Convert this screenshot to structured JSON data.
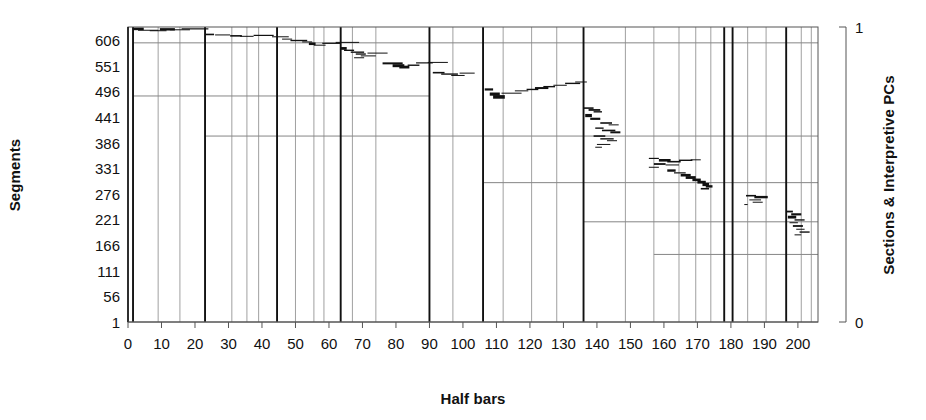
{
  "chart_data": {
    "type": "scatter",
    "title": "",
    "xlabel": "Half bars",
    "ylabel": "Segments",
    "y2label": "Sections & Interpretive PCs",
    "xlim": [
      0,
      206
    ],
    "ylim": [
      1,
      634
    ],
    "y2lim": [
      0,
      1
    ],
    "xticks": [
      0,
      10,
      20,
      30,
      40,
      50,
      60,
      70,
      80,
      90,
      100,
      110,
      120,
      130,
      140,
      150,
      160,
      170,
      180,
      190,
      200
    ],
    "xtick_labels": [
      "0",
      "10",
      "20",
      "30",
      "40",
      "50",
      "60",
      "70",
      "80",
      "90",
      "100",
      "110",
      "120",
      "130",
      "140",
      "150",
      "160",
      "170",
      "180",
      "190",
      "200"
    ],
    "yticks": [
      606,
      551,
      496,
      441,
      386,
      331,
      276,
      221,
      166,
      111,
      56,
      1
    ],
    "ytick_labels": [
      "606",
      "551",
      "496",
      "441",
      "386",
      "331",
      "276",
      "221",
      "166",
      "111",
      "56",
      "1"
    ],
    "y2ticks": [
      0,
      1
    ],
    "y2tick_labels": [
      "0",
      "1"
    ],
    "grid": "vertical-section-lines-and-sparse-horizontal-lines",
    "legend": "none",
    "series_description": "Descending staircase of short horizontal segment markers spanning half-bar positions",
    "section_lines_major": [
      1.5,
      23.0,
      44.5,
      63.5,
      90.0,
      106.0,
      136.0,
      178.0,
      180.5,
      196.5
    ],
    "section_lines_minor": [
      9.0,
      15.5,
      31.0,
      35.5,
      39.0,
      50.0,
      55.5,
      58.5,
      67.0,
      74.0,
      97.0,
      112.0,
      120.5,
      128.0,
      148.5,
      157.0,
      164.5,
      169.5,
      174.0,
      185.0,
      190.5,
      201.0,
      204.0
    ],
    "horizontal_lines": [
      {
        "y": 600,
        "x0": 1.5,
        "x1": 206
      },
      {
        "y": 486,
        "x0": 1.5,
        "x1": 90.0
      },
      {
        "y": 400,
        "x0": 23.0,
        "x1": 206
      },
      {
        "y": 300,
        "x0": 106.0,
        "x1": 206
      },
      {
        "y": 216,
        "x0": 136.0,
        "x1": 206
      },
      {
        "y": 146,
        "x0": 157.0,
        "x1": 206
      }
    ],
    "points": [
      {
        "x": 1.5,
        "y": 630,
        "w": 3.2,
        "lw": 2.6
      },
      {
        "x": 3.0,
        "y": 627,
        "w": 6.0,
        "lw": 1.0
      },
      {
        "x": 6.5,
        "y": 626,
        "w": 5.0,
        "lw": 1.0
      },
      {
        "x": 9.5,
        "y": 629,
        "w": 4.5,
        "lw": 2.4
      },
      {
        "x": 12.5,
        "y": 628,
        "w": 6.0,
        "lw": 1.0
      },
      {
        "x": 16.0,
        "y": 630,
        "w": 8.0,
        "lw": 1.2
      },
      {
        "x": 23.2,
        "y": 618,
        "w": 2.5,
        "lw": 1.6
      },
      {
        "x": 26.0,
        "y": 617,
        "w": 4.5,
        "lw": 1.0
      },
      {
        "x": 30.5,
        "y": 615,
        "w": 3.5,
        "lw": 1.6
      },
      {
        "x": 33.5,
        "y": 614,
        "w": 4.0,
        "lw": 1.0
      },
      {
        "x": 37.5,
        "y": 616,
        "w": 6.0,
        "lw": 1.2
      },
      {
        "x": 43.0,
        "y": 613,
        "w": 5.0,
        "lw": 1.0
      },
      {
        "x": 46.0,
        "y": 608,
        "w": 3.0,
        "lw": 1.0
      },
      {
        "x": 48.5,
        "y": 605,
        "w": 5.0,
        "lw": 1.4
      },
      {
        "x": 52.0,
        "y": 602,
        "w": 3.0,
        "lw": 1.0
      },
      {
        "x": 54.0,
        "y": 598,
        "w": 2.0,
        "lw": 2.6
      },
      {
        "x": 55.5,
        "y": 595,
        "w": 3.5,
        "lw": 1.0
      },
      {
        "x": 58.0,
        "y": 599,
        "w": 5.5,
        "lw": 1.2
      },
      {
        "x": 62.0,
        "y": 601,
        "w": 7.0,
        "lw": 1.0
      },
      {
        "x": 63.5,
        "y": 588,
        "w": 1.8,
        "lw": 2.8
      },
      {
        "x": 64.5,
        "y": 584,
        "w": 3.0,
        "lw": 1.4
      },
      {
        "x": 66.5,
        "y": 580,
        "w": 4.0,
        "lw": 1.4
      },
      {
        "x": 68.0,
        "y": 576,
        "w": 3.0,
        "lw": 1.4
      },
      {
        "x": 69.5,
        "y": 572,
        "w": 4.5,
        "lw": 1.0
      },
      {
        "x": 71.5,
        "y": 578,
        "w": 6.0,
        "lw": 1.0
      },
      {
        "x": 67.5,
        "y": 568,
        "w": 3.0,
        "lw": 1.0
      },
      {
        "x": 76.0,
        "y": 556,
        "w": 6.0,
        "lw": 2.0
      },
      {
        "x": 79.0,
        "y": 551,
        "w": 3.5,
        "lw": 3.0
      },
      {
        "x": 81.0,
        "y": 548,
        "w": 3.0,
        "lw": 2.8
      },
      {
        "x": 83.5,
        "y": 552,
        "w": 3.5,
        "lw": 1.4
      },
      {
        "x": 86.0,
        "y": 557,
        "w": 5.0,
        "lw": 1.2
      },
      {
        "x": 89.5,
        "y": 558,
        "w": 6.0,
        "lw": 1.0
      },
      {
        "x": 91.0,
        "y": 536,
        "w": 3.5,
        "lw": 1.6
      },
      {
        "x": 93.5,
        "y": 533,
        "w": 5.0,
        "lw": 1.4
      },
      {
        "x": 96.5,
        "y": 530,
        "w": 4.0,
        "lw": 1.0
      },
      {
        "x": 99.0,
        "y": 535,
        "w": 4.5,
        "lw": 1.0
      },
      {
        "x": 106.5,
        "y": 500,
        "w": 2.5,
        "lw": 2.2
      },
      {
        "x": 108.0,
        "y": 490,
        "w": 3.0,
        "lw": 3.2
      },
      {
        "x": 109.0,
        "y": 484,
        "w": 3.5,
        "lw": 3.6
      },
      {
        "x": 111.5,
        "y": 492,
        "w": 6.0,
        "lw": 1.0
      },
      {
        "x": 115.5,
        "y": 497,
        "w": 4.0,
        "lw": 1.0
      },
      {
        "x": 119.0,
        "y": 500,
        "w": 3.5,
        "lw": 1.4
      },
      {
        "x": 121.5,
        "y": 503,
        "w": 4.0,
        "lw": 2.0
      },
      {
        "x": 124.0,
        "y": 506,
        "w": 3.5,
        "lw": 1.4
      },
      {
        "x": 127.0,
        "y": 509,
        "w": 4.0,
        "lw": 1.0
      },
      {
        "x": 130.5,
        "y": 513,
        "w": 4.5,
        "lw": 1.4
      },
      {
        "x": 133.5,
        "y": 516,
        "w": 3.5,
        "lw": 1.0
      },
      {
        "x": 136.0,
        "y": 460,
        "w": 3.0,
        "lw": 1.6
      },
      {
        "x": 137.5,
        "y": 456,
        "w": 3.5,
        "lw": 1.8
      },
      {
        "x": 139.0,
        "y": 452,
        "w": 2.5,
        "lw": 1.4
      },
      {
        "x": 136.5,
        "y": 444,
        "w": 2.0,
        "lw": 3.2
      },
      {
        "x": 138.0,
        "y": 437,
        "w": 3.0,
        "lw": 2.2
      },
      {
        "x": 141.0,
        "y": 428,
        "w": 3.5,
        "lw": 1.6
      },
      {
        "x": 143.5,
        "y": 424,
        "w": 3.0,
        "lw": 1.0
      },
      {
        "x": 139.5,
        "y": 417,
        "w": 2.5,
        "lw": 1.4
      },
      {
        "x": 141.5,
        "y": 412,
        "w": 4.0,
        "lw": 1.6
      },
      {
        "x": 144.0,
        "y": 408,
        "w": 3.0,
        "lw": 2.0
      },
      {
        "x": 139.0,
        "y": 400,
        "w": 3.5,
        "lw": 1.6
      },
      {
        "x": 141.0,
        "y": 394,
        "w": 4.0,
        "lw": 1.4
      },
      {
        "x": 143.0,
        "y": 390,
        "w": 3.0,
        "lw": 1.0
      },
      {
        "x": 140.0,
        "y": 382,
        "w": 4.0,
        "lw": 1.0
      },
      {
        "x": 139.5,
        "y": 376,
        "w": 2.0,
        "lw": 1.0
      },
      {
        "x": 155.5,
        "y": 352,
        "w": 3.0,
        "lw": 1.2
      },
      {
        "x": 158.5,
        "y": 348,
        "w": 3.5,
        "lw": 2.6
      },
      {
        "x": 161.0,
        "y": 345,
        "w": 4.0,
        "lw": 1.6
      },
      {
        "x": 164.5,
        "y": 348,
        "w": 4.0,
        "lw": 1.4
      },
      {
        "x": 168.0,
        "y": 349,
        "w": 3.0,
        "lw": 1.0
      },
      {
        "x": 157.0,
        "y": 340,
        "w": 3.5,
        "lw": 1.8
      },
      {
        "x": 160.5,
        "y": 338,
        "w": 4.0,
        "lw": 1.0
      },
      {
        "x": 155.5,
        "y": 333,
        "w": 3.0,
        "lw": 1.0
      },
      {
        "x": 161.0,
        "y": 326,
        "w": 2.5,
        "lw": 2.4
      },
      {
        "x": 163.0,
        "y": 321,
        "w": 3.5,
        "lw": 1.2
      },
      {
        "x": 165.0,
        "y": 316,
        "w": 3.0,
        "lw": 2.6
      },
      {
        "x": 166.5,
        "y": 311,
        "w": 3.0,
        "lw": 2.8
      },
      {
        "x": 168.5,
        "y": 306,
        "w": 2.5,
        "lw": 2.6
      },
      {
        "x": 170.0,
        "y": 301,
        "w": 2.5,
        "lw": 2.8
      },
      {
        "x": 171.5,
        "y": 296,
        "w": 2.0,
        "lw": 3.2
      },
      {
        "x": 172.5,
        "y": 292,
        "w": 2.0,
        "lw": 2.4
      },
      {
        "x": 171.0,
        "y": 287,
        "w": 2.5,
        "lw": 1.6
      },
      {
        "x": 184.5,
        "y": 272,
        "w": 3.0,
        "lw": 1.6
      },
      {
        "x": 187.0,
        "y": 269,
        "w": 4.0,
        "lw": 2.4
      },
      {
        "x": 185.5,
        "y": 263,
        "w": 3.5,
        "lw": 1.0
      },
      {
        "x": 186.5,
        "y": 258,
        "w": 3.0,
        "lw": 1.0
      },
      {
        "x": 184.0,
        "y": 253,
        "w": 1.0,
        "lw": 1.0
      },
      {
        "x": 196.5,
        "y": 238,
        "w": 2.0,
        "lw": 1.8
      },
      {
        "x": 198.0,
        "y": 232,
        "w": 3.0,
        "lw": 2.2
      },
      {
        "x": 197.0,
        "y": 226,
        "w": 2.5,
        "lw": 2.8
      },
      {
        "x": 199.0,
        "y": 220,
        "w": 3.0,
        "lw": 1.4
      },
      {
        "x": 197.5,
        "y": 214,
        "w": 2.5,
        "lw": 1.0
      },
      {
        "x": 198.5,
        "y": 207,
        "w": 3.0,
        "lw": 1.8
      },
      {
        "x": 199.5,
        "y": 200,
        "w": 2.5,
        "lw": 1.0
      },
      {
        "x": 200.5,
        "y": 194,
        "w": 3.0,
        "lw": 1.4
      },
      {
        "x": 199.0,
        "y": 188,
        "w": 2.0,
        "lw": 1.0
      }
    ]
  }
}
